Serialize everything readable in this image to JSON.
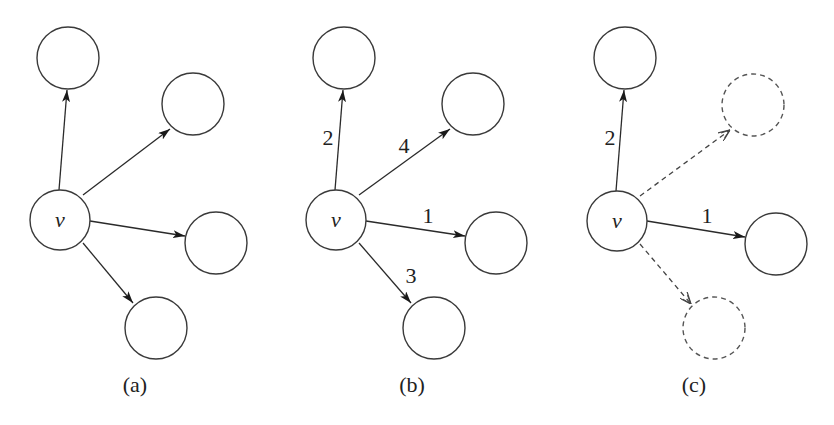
{
  "figure": {
    "panels": [
      {
        "id": "a",
        "caption": "(a)",
        "center_label": "v",
        "edges": [
          {
            "target": "top",
            "weight": "",
            "style": "solid"
          },
          {
            "target": "upper-right",
            "weight": "",
            "style": "solid"
          },
          {
            "target": "right",
            "weight": "",
            "style": "solid"
          },
          {
            "target": "bottom",
            "weight": "",
            "style": "solid"
          }
        ]
      },
      {
        "id": "b",
        "caption": "(b)",
        "center_label": "v",
        "edges": [
          {
            "target": "top",
            "weight": "2",
            "style": "solid"
          },
          {
            "target": "upper-right",
            "weight": "4",
            "style": "solid"
          },
          {
            "target": "right",
            "weight": "1",
            "style": "solid"
          },
          {
            "target": "bottom",
            "weight": "3",
            "style": "solid"
          }
        ]
      },
      {
        "id": "c",
        "caption": "(c)",
        "center_label": "v",
        "edges": [
          {
            "target": "top",
            "weight": "2",
            "style": "solid"
          },
          {
            "target": "upper-right",
            "weight": "",
            "style": "dashed"
          },
          {
            "target": "right",
            "weight": "1",
            "style": "solid"
          },
          {
            "target": "bottom",
            "weight": "",
            "style": "dashed"
          }
        ]
      }
    ]
  }
}
